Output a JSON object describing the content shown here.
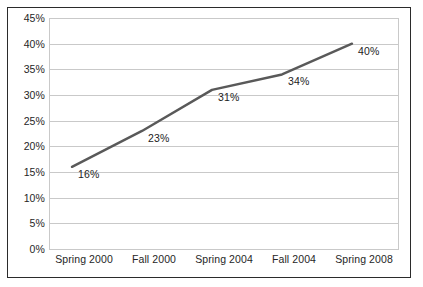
{
  "chart_data": {
    "type": "line",
    "title": "",
    "subtitle": "",
    "xlabel": "",
    "ylabel": "",
    "categories": [
      "Spring 2000",
      "Fall 2000",
      "Spring 2004",
      "Fall 2004",
      "Spring 2008"
    ],
    "values": [
      16,
      23,
      31,
      34,
      40
    ],
    "point_labels": [
      "16%",
      "23%",
      "31%",
      "34%",
      "40%"
    ],
    "ylim": [
      0,
      45
    ],
    "ytick_values": [
      0,
      5,
      10,
      15,
      20,
      25,
      30,
      35,
      40,
      45
    ],
    "ytick_labels": [
      "0%",
      "5%",
      "10%",
      "15%",
      "20%",
      "25%",
      "30%",
      "35%",
      "40%",
      "45%"
    ],
    "grid": true,
    "grid_axis": "y",
    "legend": false,
    "legend_position": "none",
    "series": [
      {
        "name": "",
        "values": [
          16,
          23,
          31,
          34,
          40
        ],
        "color": "#595959",
        "line_width": 2.4,
        "markers": false
      }
    ]
  },
  "style": {
    "frame_color": "#2b2b2b",
    "gridline_color": "#c9c9c9",
    "plot_background": "#ffffff",
    "text_color": "#262626",
    "series_color": "#595959"
  }
}
